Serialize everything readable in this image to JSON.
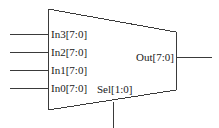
{
  "diagram": {
    "kind": "multiplexer-symbol",
    "body_shape": "trapezoid",
    "colors": {
      "stroke": "#3a3a3a",
      "text": "#1a1a1a",
      "background": "#ffffff"
    },
    "stroke_width": 1,
    "inputs": [
      {
        "id": "in3",
        "label": "In3[7:0]",
        "wire_y": 34,
        "width_bits": 8,
        "range": "7:0"
      },
      {
        "id": "in2",
        "label": "In2[7:0]",
        "wire_y": 52,
        "width_bits": 8,
        "range": "7:0"
      },
      {
        "id": "in1",
        "label": "In1[7:0]",
        "wire_y": 70,
        "width_bits": 8,
        "range": "7:0"
      },
      {
        "id": "in0",
        "label": "In0[7:0]",
        "wire_y": 88,
        "width_bits": 8,
        "range": "7:0"
      }
    ],
    "select": {
      "id": "sel",
      "label": "Sel[1:0]",
      "width_bits": 2,
      "range": "1:0",
      "wire_x": 113,
      "side": "bottom"
    },
    "outputs": [
      {
        "id": "out",
        "label": "Out[7:0]",
        "wire_y": 57,
        "width_bits": 8,
        "range": "7:0"
      }
    ],
    "geometry": {
      "left_edge_x": 48,
      "right_edge_x": 176,
      "top_left_y": 9,
      "bottom_left_y": 110,
      "top_right_y": 32,
      "bottom_right_y": 90,
      "input_wire_start_x": 10,
      "output_wire_end_x": 212,
      "select_wire_end_y": 128
    }
  }
}
